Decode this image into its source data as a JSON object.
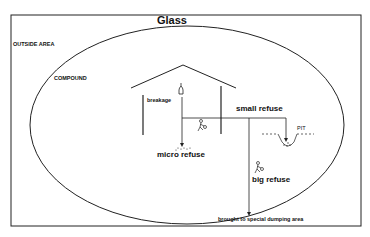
{
  "title": "Glass",
  "labels": {
    "outside_area": "OUTSIDE AREA",
    "compound": "COMPOUND",
    "breakage": "breakage",
    "small_refuse": "small refuse",
    "pit": "PIT",
    "micro_refuse": "micro refuse",
    "big_refuse": "big refuse",
    "destination": "brought to special dumping area"
  }
}
